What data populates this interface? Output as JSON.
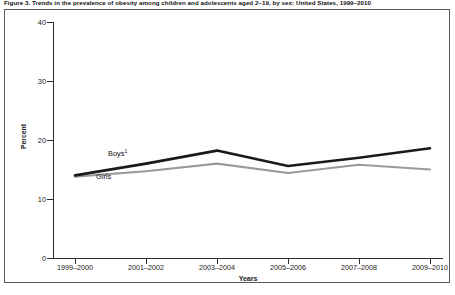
{
  "figure": {
    "title": "Figure 3. Trends in the prevalence of obesity among children and adolescents aged 2–19, by sex: United States, 1999–2010"
  },
  "chart_data": {
    "type": "line",
    "title": "Figure 3. Trends in the prevalence of obesity among children and adolescents aged 2–19, by sex: United States, 1999–2010",
    "xlabel": "Years",
    "ylabel": "Percent",
    "ylim": [
      0,
      40
    ],
    "yticks": [
      0,
      10,
      20,
      30,
      40
    ],
    "grid": false,
    "legend_position": "inline-annotation",
    "categories": [
      "1999–2000",
      "2001–2002",
      "2003–2004",
      "2005–2006",
      "2007–2008",
      "2009–2010"
    ],
    "series": [
      {
        "name": "Boys",
        "label": "Boys",
        "footnote_marker": "1",
        "color": "#1a1a1a",
        "values": [
          14.0,
          16.0,
          18.2,
          15.6,
          17.0,
          18.6
        ]
      },
      {
        "name": "Girls",
        "label": "Girls",
        "footnote_marker": "",
        "color": "#9a9a9a",
        "values": [
          13.8,
          14.7,
          16.0,
          14.4,
          15.8,
          15.0
        ]
      }
    ]
  }
}
